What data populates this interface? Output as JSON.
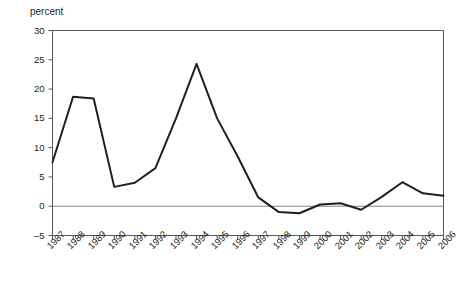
{
  "chart_data": {
    "type": "line",
    "title": "",
    "subtitle": "",
    "xlabel": "",
    "ylabel": "percent",
    "ylim": [
      -5,
      30
    ],
    "xlim": [
      1987,
      2006
    ],
    "grid": false,
    "legend": "none",
    "zero_line": 0,
    "y_ticks": [
      30,
      25,
      20,
      15,
      10,
      5,
      0,
      -5
    ],
    "y_tick_labels": [
      "30",
      "25",
      "20",
      "15",
      "10",
      "5",
      "0",
      "–5"
    ],
    "categories": [
      "1987",
      "1988",
      "1989",
      "1990",
      "1991",
      "1992",
      "1993",
      "1994",
      "1995",
      "1996",
      "1997",
      "1998",
      "1999",
      "2000",
      "2001",
      "2002",
      "2003",
      "2004",
      "2005",
      "2006"
    ],
    "series": [
      {
        "name": "percent",
        "color": "#231f20",
        "values": [
          7.5,
          18.7,
          18.4,
          3.3,
          4.0,
          6.5,
          15.0,
          24.3,
          15.0,
          8.5,
          1.5,
          -1.0,
          -1.2,
          0.3,
          0.5,
          -0.6,
          1.6,
          4.1,
          2.2,
          1.8
        ]
      }
    ]
  },
  "axis": {
    "title": "percent"
  },
  "colors": {
    "line": "#231f20",
    "frame": "#58595b",
    "zero_line": "#808285",
    "background": "#ffffff"
  }
}
